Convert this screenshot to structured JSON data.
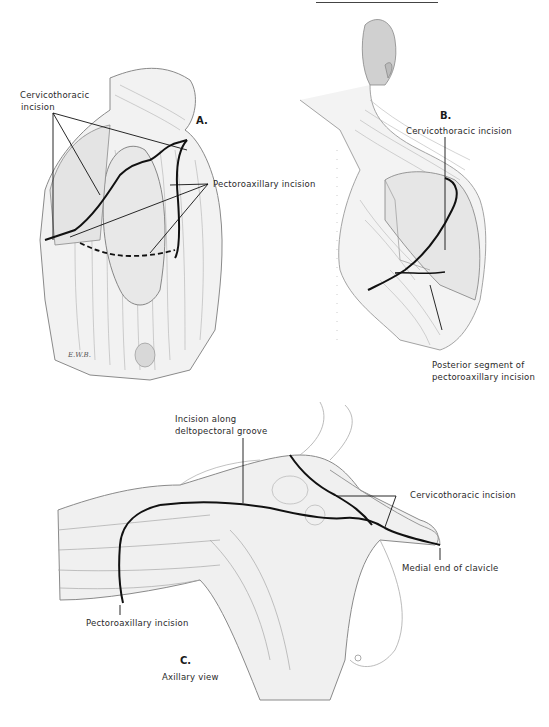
{
  "figure": {
    "type": "anatomical-illustration",
    "colors": {
      "ink": "#1a1a1a",
      "shading": "#9a9a9a",
      "background": "#ffffff"
    }
  },
  "panels": {
    "A": {
      "letter": "A.",
      "labels": {
        "cervicothoracic_line1": "Cervicothoracic",
        "cervicothoracic_line2": "incision",
        "pectoroaxillary": "Pectoroaxillary incision"
      },
      "signature": "E.W.B."
    },
    "B": {
      "letter": "B.",
      "labels": {
        "cervicothoracic": "Cervicothoracic incision",
        "posterior_line1": "Posterior segment of",
        "posterior_line2": "pectoroaxillary incision"
      }
    },
    "C": {
      "letter": "C.",
      "caption": "Axillary view",
      "labels": {
        "deltopectoral_line1": "Incision along",
        "deltopectoral_line2": "deltopectoral groove",
        "cervicothoracic": "Cervicothoracic incision",
        "medial_clavicle": "Medial end of clavicle",
        "pectoroaxillary": "Pectoroaxillary incision"
      }
    }
  }
}
